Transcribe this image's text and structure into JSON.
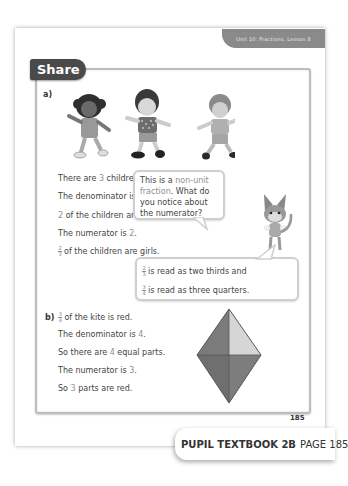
{
  "header": {
    "unit_label": "Unit 10: Fractions, Lesson 8"
  },
  "section": {
    "title": "Share"
  },
  "part_a": {
    "label": "a)",
    "illustration": [
      "girl-1",
      "girl-2",
      "boy"
    ],
    "lines": [
      {
        "pre": "There are ",
        "num": "3",
        "post": " children."
      },
      {
        "pre": "The denominator is ",
        "num": "3",
        "post": "."
      },
      {
        "pre": "",
        "num": "2",
        "post": " of the children are girls."
      },
      {
        "pre": "The numerator is ",
        "num": "2",
        "post": "."
      }
    ],
    "fraction_line": {
      "numerator": "2",
      "denominator": "3",
      "text": "of the children are girls."
    }
  },
  "bubble_top": {
    "pre": "This is a ",
    "highlight": "non-unit fraction",
    "post": ". What do you notice about the numerator?"
  },
  "bubble_bottom": {
    "line1": {
      "numerator": "2",
      "denominator": "3",
      "text": "is read as two thirds and"
    },
    "line2": {
      "numerator": "3",
      "denominator": "4",
      "text": "is read as three quarters."
    }
  },
  "part_b": {
    "label": "b)",
    "fraction_line": {
      "numerator": "3",
      "denominator": "4",
      "text": "of the kite is red."
    },
    "lines": [
      {
        "pre": "The denominator is ",
        "num": "4",
        "post": "."
      },
      {
        "pre": "So there are ",
        "num": "4",
        "post": " equal parts."
      },
      {
        "pre": "The numerator is ",
        "num": "3",
        "post": "."
      },
      {
        "pre": "So ",
        "num": "3",
        "post": " parts are red."
      }
    ]
  },
  "kite": {
    "parts": 4,
    "shaded": 3,
    "colors": {
      "shaded": "#7b7b7b",
      "shaded_dark": "#6f6f6f",
      "unshaded": "#d6d6d6",
      "outline": "#555555"
    }
  },
  "page_number": "185",
  "footer": {
    "book": "PUPIL TEXTBOOK 2B",
    "page": "PAGE 185"
  }
}
